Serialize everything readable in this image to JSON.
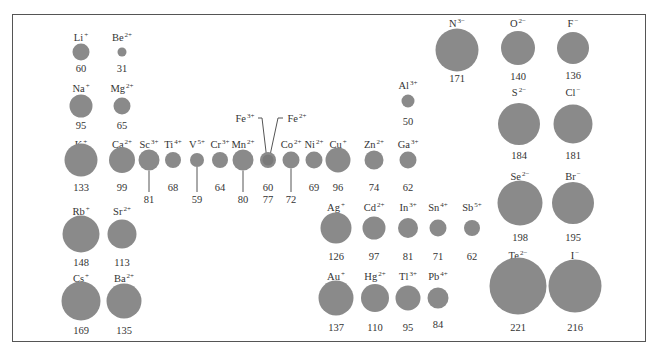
{
  "figure": {
    "title": "",
    "units": "pm",
    "circle_color": "#8a8a8a",
    "border_color": "#555555"
  },
  "ions": [
    {
      "id": "li",
      "symbol": "Li",
      "charge": "+",
      "radius": "60",
      "cx": 81,
      "cy": 52,
      "d": 17,
      "ly": 32,
      "vy": 64
    },
    {
      "id": "be",
      "symbol": "Be",
      "charge": "2+",
      "radius": "31",
      "cx": 122,
      "cy": 52,
      "d": 9,
      "ly": 32,
      "vy": 64
    },
    {
      "id": "na",
      "symbol": "Na",
      "charge": "+",
      "radius": "95",
      "cx": 81,
      "cy": 106,
      "d": 23,
      "ly": 83,
      "vy": 121
    },
    {
      "id": "mg",
      "symbol": "Mg",
      "charge": "2+",
      "radius": "65",
      "cx": 122,
      "cy": 106,
      "d": 17,
      "ly": 83,
      "vy": 121
    },
    {
      "id": "k",
      "symbol": "K",
      "charge": "+",
      "radius": "133",
      "cx": 81,
      "cy": 160,
      "d": 33,
      "ly": 139,
      "vy": 183
    },
    {
      "id": "ca",
      "symbol": "Ca",
      "charge": "2+",
      "radius": "99",
      "cx": 122,
      "cy": 160,
      "d": 26,
      "ly": 139,
      "vy": 183
    },
    {
      "id": "sc",
      "symbol": "Sc",
      "charge": "3+",
      "radius": "81",
      "cx": 149,
      "cy": 160,
      "d": 21,
      "ly": 139,
      "vy": 195,
      "stem": true
    },
    {
      "id": "ti",
      "symbol": "Ti",
      "charge": "4+",
      "radius": "68",
      "cx": 173,
      "cy": 160,
      "d": 16,
      "ly": 139,
      "vy": 183
    },
    {
      "id": "v",
      "symbol": "V",
      "charge": "5+",
      "radius": "59",
      "cx": 197,
      "cy": 160,
      "d": 14,
      "ly": 139,
      "vy": 195,
      "stem": true
    },
    {
      "id": "cr",
      "symbol": "Cr",
      "charge": "3+",
      "radius": "64",
      "cx": 220,
      "cy": 160,
      "d": 16,
      "ly": 139,
      "vy": 183
    },
    {
      "id": "mn",
      "symbol": "Mn",
      "charge": "2+",
      "radius": "80",
      "cx": 243,
      "cy": 160,
      "d": 21,
      "ly": 139,
      "vy": 195,
      "stem": true
    },
    {
      "id": "fe",
      "symbol": "Fe",
      "charge": "3+",
      "radius": "60",
      "cx": 268,
      "cy": 160,
      "d": 16,
      "ly": -1,
      "vy": 183
    },
    {
      "id": "co",
      "symbol": "Co",
      "charge": "2+",
      "radius": "72",
      "cx": 291,
      "cy": 160,
      "d": 17,
      "ly": 139,
      "vy": 195,
      "stem": true
    },
    {
      "id": "ni",
      "symbol": "Ni",
      "charge": "2+",
      "radius": "69",
      "cx": 314,
      "cy": 160,
      "d": 17,
      "ly": 139,
      "vy": 183
    },
    {
      "id": "cu",
      "symbol": "Cu",
      "charge": "+",
      "radius": "96",
      "cx": 338,
      "cy": 160,
      "d": 25,
      "ly": 139,
      "vy": 183
    },
    {
      "id": "zn",
      "symbol": "Zn",
      "charge": "2+",
      "radius": "74",
      "cx": 374,
      "cy": 160,
      "d": 19,
      "ly": 139,
      "vy": 183
    },
    {
      "id": "ga",
      "symbol": "Ga",
      "charge": "3+",
      "radius": "62",
      "cx": 408,
      "cy": 160,
      "d": 17,
      "ly": 139,
      "vy": 183
    },
    {
      "id": "al",
      "symbol": "Al",
      "charge": "3+",
      "radius": "50",
      "cx": 408,
      "cy": 101,
      "d": 13,
      "ly": 80,
      "vy": 117
    },
    {
      "id": "rb",
      "symbol": "Rb",
      "charge": "+",
      "radius": "148",
      "cx": 81,
      "cy": 234,
      "d": 37,
      "ly": 206,
      "vy": 258
    },
    {
      "id": "sr",
      "symbol": "Sr",
      "charge": "2+",
      "radius": "113",
      "cx": 122,
      "cy": 234,
      "d": 29,
      "ly": 206,
      "vy": 258
    },
    {
      "id": "cs",
      "symbol": "Cs",
      "charge": "+",
      "radius": "169",
      "cx": 81,
      "cy": 301,
      "d": 39,
      "ly": 273,
      "vy": 326
    },
    {
      "id": "ba",
      "symbol": "Ba",
      "charge": "2+",
      "radius": "135",
      "cx": 124,
      "cy": 301,
      "d": 35,
      "ly": 273,
      "vy": 326
    },
    {
      "id": "ag",
      "symbol": "Ag",
      "charge": "+",
      "radius": "126",
      "cx": 336,
      "cy": 228,
      "d": 31,
      "ly": 202,
      "vy": 252
    },
    {
      "id": "cd",
      "symbol": "Cd",
      "charge": "2+",
      "radius": "97",
      "cx": 374,
      "cy": 228,
      "d": 23,
      "ly": 202,
      "vy": 252
    },
    {
      "id": "in",
      "symbol": "In",
      "charge": "3+",
      "radius": "81",
      "cx": 408,
      "cy": 228,
      "d": 20,
      "ly": 202,
      "vy": 252
    },
    {
      "id": "sn",
      "symbol": "Sn",
      "charge": "4+",
      "radius": "71",
      "cx": 438,
      "cy": 228,
      "d": 17,
      "ly": 202,
      "vy": 252
    },
    {
      "id": "sb",
      "symbol": "Sb",
      "charge": "5+",
      "radius": "62",
      "cx": 472,
      "cy": 228,
      "d": 16,
      "ly": 202,
      "vy": 252
    },
    {
      "id": "au",
      "symbol": "Au",
      "charge": "+",
      "radius": "137",
      "cx": 336,
      "cy": 298,
      "d": 35,
      "ly": 271,
      "vy": 323
    },
    {
      "id": "hg",
      "symbol": "Hg",
      "charge": "2+",
      "radius": "110",
      "cx": 375,
      "cy": 298,
      "d": 28,
      "ly": 271,
      "vy": 323
    },
    {
      "id": "tl",
      "symbol": "Tl",
      "charge": "3+",
      "radius": "95",
      "cx": 408,
      "cy": 298,
      "d": 25,
      "ly": 271,
      "vy": 323
    },
    {
      "id": "pb",
      "symbol": "Pb",
      "charge": "4+",
      "radius": "84",
      "cx": 438,
      "cy": 298,
      "d": 21,
      "ly": 271,
      "vy": 320
    },
    {
      "id": "n",
      "symbol": "N",
      "charge": "3−",
      "radius": "171",
      "cx": 457,
      "cy": 50,
      "d": 43,
      "ly": 18,
      "vy": 74
    },
    {
      "id": "o",
      "symbol": "O",
      "charge": "2−",
      "radius": "140",
      "cx": 518,
      "cy": 48,
      "d": 34,
      "ly": 18,
      "vy": 72
    },
    {
      "id": "f",
      "symbol": "F",
      "charge": "−",
      "radius": "136",
      "cx": 573,
      "cy": 48,
      "d": 32,
      "ly": 18,
      "vy": 71
    },
    {
      "id": "s",
      "symbol": "S",
      "charge": "2−",
      "radius": "184",
      "cx": 519,
      "cy": 124,
      "d": 42,
      "ly": 87,
      "vy": 151
    },
    {
      "id": "cl",
      "symbol": "Cl",
      "charge": "−",
      "radius": "181",
      "cx": 573,
      "cy": 124,
      "d": 39,
      "ly": 87,
      "vy": 151
    },
    {
      "id": "se",
      "symbol": "Se",
      "charge": "2−",
      "radius": "198",
      "cx": 520,
      "cy": 203,
      "d": 45,
      "ly": 171,
      "vy": 233
    },
    {
      "id": "br",
      "symbol": "Br",
      "charge": "−",
      "radius": "195",
      "cx": 573,
      "cy": 203,
      "d": 42,
      "ly": 171,
      "vy": 233
    },
    {
      "id": "te",
      "symbol": "Te",
      "charge": "2−",
      "radius": "221",
      "cx": 518,
      "cy": 286,
      "d": 57,
      "ly": 250,
      "vy": 323
    },
    {
      "id": "i",
      "symbol": "I",
      "charge": "−",
      "radius": "216",
      "cx": 575,
      "cy": 286,
      "d": 53,
      "ly": 250,
      "vy": 323
    }
  ],
  "iron_callouts": {
    "fe3": {
      "symbol": "Fe",
      "charge": "3+",
      "radius": "60",
      "label_x": 245,
      "label_y": 118
    },
    "fe2": {
      "symbol": "Fe",
      "charge": "2+",
      "radius": "77",
      "label_x": 297,
      "label_y": 118,
      "value_y": 195
    }
  }
}
